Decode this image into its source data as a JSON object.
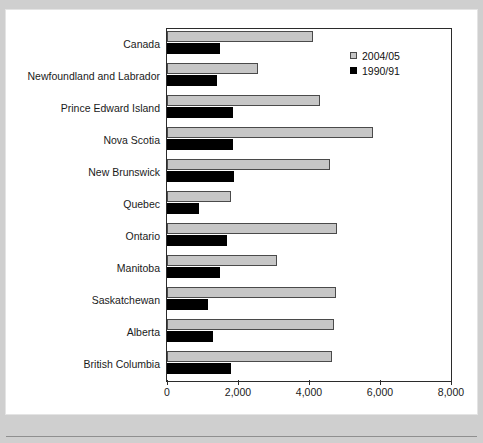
{
  "chart_data": {
    "type": "bar",
    "orientation": "horizontal",
    "title": "",
    "subtitle": "",
    "xlabel": "",
    "ylabel": "",
    "xlim": [
      0,
      8000
    ],
    "xticks": [
      0,
      2000,
      4000,
      6000,
      8000
    ],
    "xtick_labels": [
      "0",
      "2,000",
      "4,000",
      "6,000",
      "8,000"
    ],
    "grid": false,
    "legend_position": "top-right",
    "categories": [
      "Canada",
      "Newfoundland and Labrador",
      "Prince Edward Island",
      "Nova Scotia",
      "New Brunswick",
      "Quebec",
      "Ontario",
      "Manitoba",
      "Saskatchewan",
      "Alberta",
      "British Columbia"
    ],
    "series": [
      {
        "name": "2004/05",
        "color": "#c6c6c6",
        "values": [
          4100,
          2550,
          4300,
          5800,
          4600,
          1800,
          4800,
          3100,
          4750,
          4700,
          4650
        ]
      },
      {
        "name": "1990/91",
        "color": "#000000",
        "values": [
          1500,
          1400,
          1850,
          1850,
          1900,
          900,
          1700,
          1500,
          1150,
          1300,
          1800
        ]
      }
    ]
  },
  "legend": {
    "items": [
      {
        "label": "2004/05",
        "swatch": "legend-swatch-gray"
      },
      {
        "label": "1990/91",
        "swatch": "legend-swatch-black"
      }
    ]
  }
}
